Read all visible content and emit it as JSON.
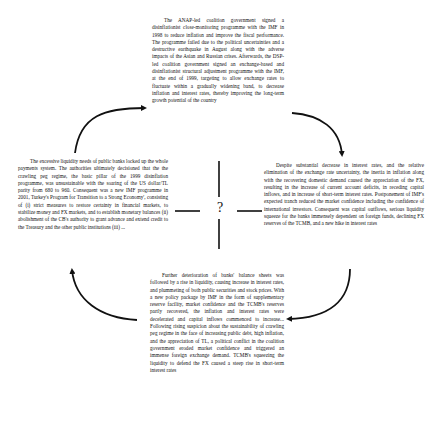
{
  "diagram": {
    "type": "cycle",
    "center_label": "?",
    "blocks": {
      "top": {
        "text": "The ANAP-led coalition government signed a disinflationist close-monitoring programme with the IMF in 1998 to reduce inflation and improve the fiscal performance. The programme failed due to the political uncertainties and a destructive earthquake in August along with the adverse impacts of the Asian and Russian crises. Afterwards, the DSP-led coalition government signed an exchange-based and disinflationist structural adjustment programme with the IMF, at the end of 1999, targeting to allow exchange rates to fluctuate within a gradually widening band, to decrease inflation and interest rates, thereby improving the long-term growth potential of the country"
      },
      "right": {
        "text": "Despite substantial decrease in interest rates, and the relative elimination of the exchange rate uncertainty, the inertia in inflation along with the recovering domestic demand caused the appreciation of the FX, resulting in the increase of current account deficits, in receding capital inflows, and in increase of short-term interest rates. Postponement of IMF's expected tranch reduced the market confidence including the confidence of international investors. Consequent was capital outflows, serious liquidity squeeze for the banks immensely dependent on foreign funds, declining FX reserves of the TCMB, and a new hike in interest rates"
      },
      "bottom": {
        "text": "Further deterioration of banks' balance sheets was followed by a rise in liquidity, causing increase in interest rates, and plummeting of both public securities and stock prices. With a new policy package by IMF in the form of supplementary reserve facility, market confidence and the TCMB's reserves partly recovered, the inflation and interest rates were decelerated and capital inflows commenced to increase... Following rising suspicion about the sustainability of crawling peg regime in the face of increasing public debt, high inflation, and the appreciation of TL, a political conflict in the coalition government eroded market confidence and triggered an immense foreign exchange demand. TCMB's squeezing the liquidity to defend the FX caused a steep rise in short-term interest rates"
      },
      "left": {
        "text": "The excessive liquidity needs of public banks locked up the whole payments system. The authorities ultimately decisioned that the the crawling peg regime, the basic pillar of the 1999 disinflation programme, was unsustainable with the soaring of the US dollar/TL parity from 680 to 960. Consequent was a new IMF programme in 2001, Turkey's Program for Transition to a Strong Economy', consisting of (i) strict measures to restore certainty in financial markets, to stabilize money and FX markets, and to establish monetary balances (ii) abolishment of the CB's authority to grant advance and extend credit to the Treasury and the other public institutions (iii) ..."
      }
    },
    "arrows": [
      {
        "from": "left",
        "to": "top",
        "direction": "clockwise"
      },
      {
        "from": "top",
        "to": "right",
        "direction": "clockwise"
      },
      {
        "from": "right",
        "to": "bottom",
        "direction": "clockwise"
      },
      {
        "from": "bottom",
        "to": "left",
        "direction": "clockwise"
      }
    ],
    "colors": {
      "text": "#111111",
      "arrow": "#111111",
      "background": "#ffffff"
    }
  }
}
